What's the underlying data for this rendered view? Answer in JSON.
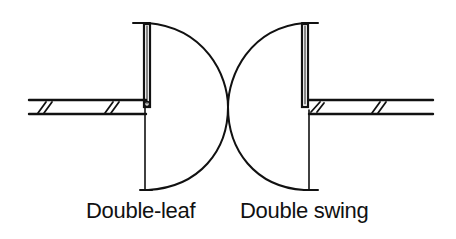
{
  "diagram": {
    "stroke_color": "#111111",
    "background": "#ffffff",
    "symbols": [
      {
        "label": "Double-leaf",
        "type": "door-swing",
        "hinge_side": "left-wall",
        "swing_direction": "right"
      },
      {
        "label": "Double swing",
        "type": "door-swing",
        "hinge_side": "right-wall",
        "swing_direction": "left"
      }
    ]
  }
}
